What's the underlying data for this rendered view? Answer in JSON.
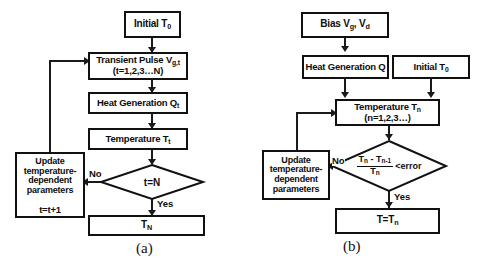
{
  "figure": {
    "kind": "flowchart-pair",
    "captions": {
      "left": "(a)",
      "right": "(b)"
    },
    "colors": {
      "stroke": "#111111",
      "fill": "#ffffff",
      "text": "#0d0d0d"
    }
  },
  "panel_a": {
    "caption": "(a)",
    "nodes": {
      "initial": {
        "name": "initial-temperature",
        "shape": "rect",
        "text": "Initial T",
        "sub": "0"
      },
      "pulse_line1_pre": "Transient Pulse V",
      "pulse_line1_sub": "g,t",
      "pulse_line2": "(t=1,2,3…N)",
      "heat_pre": "Heat Generation Q",
      "heat_sub": "t",
      "temp_pre": "Temperature T",
      "temp_sub": "t",
      "decision": "t=N",
      "update_line1": "Update",
      "update_line2": "temperature-",
      "update_line3": "dependent",
      "update_line4": "parameters",
      "update_counter": "t=t+1",
      "output_pre": "T",
      "output_sub": "N"
    },
    "edge_labels": {
      "no": "No",
      "yes": "Yes"
    }
  },
  "panel_b": {
    "caption": "(b)",
    "nodes": {
      "bias_pre": "Bias V",
      "bias_sub1": "g",
      "bias_mid": ", V",
      "bias_sub2": "d",
      "heat": "Heat Generation Q",
      "initial_pre": "Initial T",
      "initial_sub": "0",
      "temp_line1_pre": "Temperature T",
      "temp_line1_sub": "n",
      "temp_line2": "(n=1,2,3…)",
      "decision_num_a": "T",
      "decision_num_a_sub": "n",
      "decision_num_minus": " - T",
      "decision_num_b_sub": "n-1",
      "decision_den": "T",
      "decision_den_sub": "n",
      "decision_cmp": "<error",
      "update_line1": "Update",
      "update_line2": "temperature-",
      "update_line3": "dependent",
      "update_line4": "parameters",
      "output_pre": "T=T",
      "output_sub": "n"
    },
    "edge_labels": {
      "no": "No",
      "yes": "Yes"
    }
  }
}
